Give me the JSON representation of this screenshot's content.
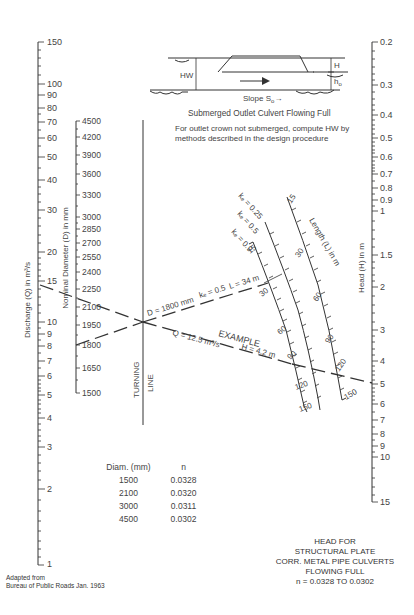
{
  "inset": {
    "labels": {
      "hw": "HW",
      "h": "H",
      "ho": "h",
      "ho_sub": "o",
      "slope": "Slope S",
      "slope_sub": "o",
      "slope_arrow": "→"
    },
    "caption": "Submerged Outlet Culvert Flowing Full",
    "note_line1": "For outlet crown not submerged, compute HW by",
    "note_line2": "methods described in the design procedure"
  },
  "axes": {
    "discharge": {
      "label": "Discharge (Q) in m³/s",
      "ticks": [
        "150",
        "100",
        "90",
        "80",
        "70",
        "60",
        "50",
        "40",
        "30",
        "20",
        "15",
        "10",
        "9",
        "8",
        "7",
        "6",
        "5",
        "4",
        "3",
        "2",
        "1"
      ]
    },
    "diameter": {
      "label": "Nominal Diameter (D) in mm",
      "ticks": [
        "4500",
        "4200",
        "3900",
        "3600",
        "3300",
        "3000",
        "2850",
        "2700",
        "2550",
        "2400",
        "2250",
        "2100",
        "1950",
        "1800",
        "1650",
        "1500"
      ]
    },
    "turning_line": {
      "label1": "TURNING",
      "label2": "LINE"
    },
    "head": {
      "label": "Head (H) in m",
      "ticks": [
        "0.2",
        "0.3",
        "0.4",
        "0.5",
        "0.6",
        "0.7",
        "0.8",
        "0.9",
        "1",
        "1.5",
        "2",
        "3",
        "4",
        "5",
        "6",
        "7",
        "8",
        "9",
        "10",
        "15"
      ]
    },
    "length": {
      "label": "Length (L) in m",
      "curves": [
        {
          "ke": "kₑ = 0.25",
          "ticks": [
            "15",
            "30",
            "60",
            "90",
            "120",
            "150"
          ]
        },
        {
          "ke": "kₑ = 0.5",
          "ticks": [
            "30",
            "60",
            "90",
            "120",
            "150"
          ]
        },
        {
          "ke": "kₑ = 0.9",
          "ticks": [
            "15",
            "30",
            "60",
            "90",
            "120",
            "150"
          ]
        }
      ]
    }
  },
  "example": {
    "title": "EXAMPLE",
    "d": "D = 1800 mm",
    "ke": "kₑ = 0.5",
    "l": "L = 34 m",
    "q": "Q = 12.5 m³/s",
    "h": "H = 4.2 m"
  },
  "n_table": {
    "headers": [
      "Diam. (mm)",
      "n"
    ],
    "rows": [
      [
        "1500",
        "0.0328"
      ],
      [
        "2100",
        "0.0320"
      ],
      [
        "3000",
        "0.0311"
      ],
      [
        "4500",
        "0.0302"
      ]
    ]
  },
  "title_block": {
    "line1": "HEAD FOR",
    "line2": "STRUCTURAL PLATE",
    "line3": "CORR. METAL PIPE CULVERTS",
    "line4": "FLOWING FULL",
    "line5": "n = 0.0328 TO 0.0302"
  },
  "credit": {
    "line1": "Adapted from",
    "line2": "Bureau of Public Roads Jan. 1963"
  }
}
